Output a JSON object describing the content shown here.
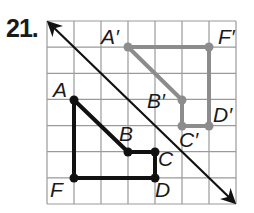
{
  "problem": {
    "number": "21."
  },
  "grid": {
    "x0": 47,
    "y0": 21,
    "cols": 7,
    "rows": 7,
    "cell_w": 27,
    "cell_h": 26.14,
    "line_color": "#9a9a9a"
  },
  "reflection_line": {
    "x1": 49,
    "y1": 23,
    "x2": 234,
    "y2": 202,
    "color": "#111111",
    "arrows": "both"
  },
  "original_figure": {
    "color": "#111111",
    "points": [
      {
        "label": "A",
        "x": 74,
        "y": 100,
        "lx": 53,
        "ly": 97
      },
      {
        "label": "B",
        "x": 128,
        "y": 152,
        "lx": 119,
        "ly": 141
      },
      {
        "label": "C",
        "x": 155,
        "y": 152,
        "lx": 158,
        "ly": 166
      },
      {
        "label": "D",
        "x": 155,
        "y": 178,
        "lx": 155,
        "ly": 197
      },
      {
        "label": "F",
        "x": 74,
        "y": 178,
        "lx": 50,
        "ly": 197
      }
    ]
  },
  "image_figure": {
    "color": "#8c8c8c",
    "points": [
      {
        "label": "A′",
        "x": 128,
        "y": 47,
        "lx": 101,
        "ly": 44
      },
      {
        "label": "F′",
        "x": 209,
        "y": 47,
        "lx": 218,
        "ly": 44
      },
      {
        "label": "D′",
        "x": 209,
        "y": 126,
        "lx": 213,
        "ly": 122
      },
      {
        "label": "C′",
        "x": 182,
        "y": 126,
        "lx": 179,
        "ly": 147
      },
      {
        "label": "B′",
        "x": 182,
        "y": 100,
        "lx": 147,
        "ly": 108
      }
    ]
  }
}
